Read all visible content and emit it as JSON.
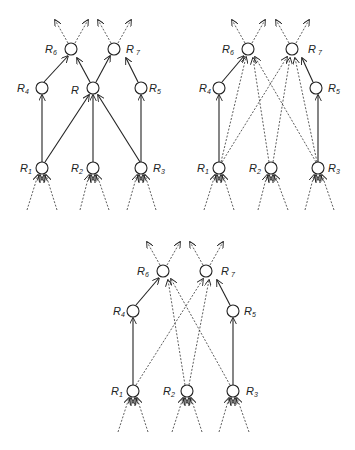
{
  "diagrams": [
    {
      "id": "network-with-R",
      "nodes": {
        "R6": {
          "label": "R",
          "sub": "6"
        },
        "R7": {
          "label": "R",
          "sub": "7"
        },
        "R4": {
          "label": "R",
          "sub": "4"
        },
        "R": {
          "label": "R",
          "sub": ""
        },
        "R5": {
          "label": "R",
          "sub": "5"
        },
        "R1": {
          "label": "R",
          "sub": "1"
        },
        "R2": {
          "label": "R",
          "sub": "2"
        },
        "R3": {
          "label": "R",
          "sub": "3"
        }
      },
      "connections": "solid: R1->R4, R1->R, R2->R, R3->R, R3->R5, R4->R6, R->R6, R->R7, R5->R7"
    },
    {
      "id": "network-dashed-direct",
      "nodes": {
        "R6": {
          "label": "R",
          "sub": "6"
        },
        "R7": {
          "label": "R",
          "sub": "7"
        },
        "R4": {
          "label": "R",
          "sub": "4"
        },
        "R5": {
          "label": "R",
          "sub": "5"
        },
        "R1": {
          "label": "R",
          "sub": "1"
        },
        "R2": {
          "label": "R",
          "sub": "2"
        },
        "R3": {
          "label": "R",
          "sub": "3"
        }
      },
      "connections": "solid: R1->R4, R3->R5, R4->R6, R5->R7; dashed: R1->R6, R1->R7, R2->R6, R2->R7, R3->R6, R3->R7"
    },
    {
      "id": "network-dashed-crossed",
      "nodes": {
        "R6": {
          "label": "R",
          "sub": "6"
        },
        "R7": {
          "label": "R",
          "sub": "7"
        },
        "R4": {
          "label": "R",
          "sub": "4"
        },
        "R5": {
          "label": "R",
          "sub": "5"
        },
        "R1": {
          "label": "R",
          "sub": "1"
        },
        "R2": {
          "label": "R",
          "sub": "2"
        },
        "R3": {
          "label": "R",
          "sub": "3"
        }
      },
      "connections": "solid: R1->R4, R3->R5, R4->R6, R5->R7; dashed: R1->R7, R2->R6, R2->R7, R3->R6"
    }
  ]
}
